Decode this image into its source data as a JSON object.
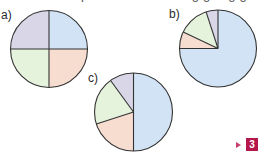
{
  "header": {
    "clipped_text": "Which pie chart is showing going going going"
  },
  "labels": {
    "a": "a)",
    "b": "b)",
    "c": "c)"
  },
  "badge": {
    "number": "3",
    "color": "#b5174a"
  },
  "colors": {
    "lavender": "#d9d6e8",
    "blue": "#d2e3f5",
    "green": "#e5f2dc",
    "peach": "#f6ddd0",
    "outline": "#333333"
  },
  "chart_data": [
    {
      "type": "pie",
      "title": "a)",
      "categories": [
        "blue",
        "peach",
        "green",
        "lavender"
      ],
      "values": [
        25,
        25,
        25,
        25
      ],
      "start_angle": "top, clockwise",
      "colors": [
        "#d2e3f5",
        "#f6ddd0",
        "#e5f2dc",
        "#d9d6e8"
      ],
      "center": [
        49,
        49
      ],
      "radius": 38.5
    },
    {
      "type": "pie",
      "title": "b)",
      "categories": [
        "blue",
        "peach",
        "green",
        "lavender"
      ],
      "values": [
        75,
        7,
        13,
        5
      ],
      "start_angle": "top, clockwise",
      "colors": [
        "#d2e3f5",
        "#f6ddd0",
        "#e5f2dc",
        "#d9d6e8"
      ],
      "center": [
        218,
        48.5
      ],
      "radius": 38.5
    },
    {
      "type": "pie",
      "title": "c)",
      "categories": [
        "blue",
        "peach",
        "green",
        "lavender"
      ],
      "values": [
        50,
        20,
        20,
        10
      ],
      "start_angle": "top, clockwise",
      "colors": [
        "#d2e3f5",
        "#f6ddd0",
        "#e5f2dc",
        "#d9d6e8"
      ],
      "center": [
        133.5,
        112
      ],
      "radius": 39
    }
  ]
}
